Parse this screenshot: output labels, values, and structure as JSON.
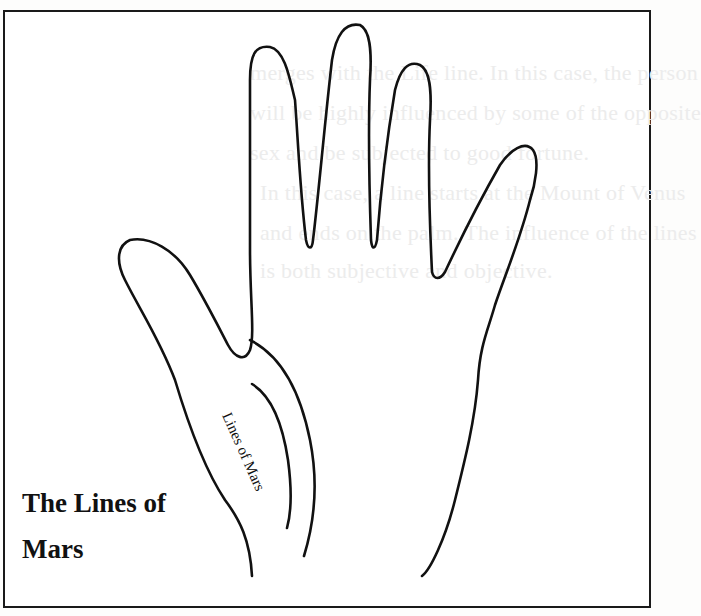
{
  "figure": {
    "caption_lines": [
      "The Lines of",
      "Mars"
    ],
    "line_label": "Lines of Mars",
    "stroke_color": "#111111",
    "border_color": "#1a1a1a"
  },
  "bleed_through": [
    "merges with the Life line. In this case, the person",
    "will be highly influenced by some of the opposite",
    "sex and be subjected to good fortune.",
    "In this case, a line starts at the Mount of Venus",
    "and ends on the palm. The influence of the lines",
    "is both subjective and objective."
  ]
}
